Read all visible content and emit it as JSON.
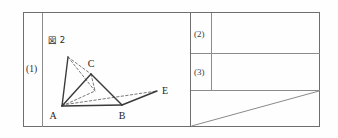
{
  "sheet": {
    "type": "answer-sheet-grid",
    "background_color": "#ffffff",
    "frame_color": "#6e6e6e",
    "ink_color": "#3a3a3a"
  },
  "left_panel": {
    "question_number_label": "(1)",
    "figure_caption": "図 2",
    "figure": {
      "name": "figure-2-geometry",
      "description": "folded triangle diagram with vertices A, B, C, E and an unlabeled apex",
      "vertex_labels": [
        "A",
        "B",
        "C",
        "E"
      ],
      "points": {
        "A": [
          62,
          106
        ],
        "B": [
          122,
          105
        ],
        "C": [
          91,
          74
        ],
        "E": [
          158,
          92
        ],
        "apex": [
          68,
          57
        ]
      },
      "solid_segments": [
        [
          "A",
          "B"
        ],
        [
          "A",
          "C"
        ],
        [
          "B",
          "C"
        ],
        [
          "A",
          "apex"
        ],
        [
          "B",
          "E"
        ]
      ],
      "dashed_segments": [
        [
          "apex",
          "C"
        ],
        [
          "apex",
          "A"
        ],
        [
          "A",
          "E"
        ],
        [
          "C",
          "D_foot"
        ]
      ]
    }
  },
  "right_panel": {
    "rows": [
      {
        "number_label": "(2)",
        "answer_value": ""
      },
      {
        "number_label": "(3)",
        "answer_value": ""
      }
    ],
    "bottom_cell": {
      "name": "working-area",
      "content": "",
      "has_diagonal_rule": true
    }
  }
}
